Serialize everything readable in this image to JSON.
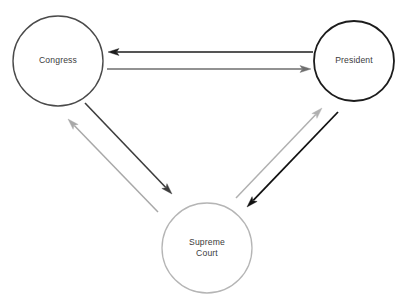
{
  "diagram": {
    "type": "node-link-diagram",
    "background_color": "#ffffff",
    "nodes": [
      {
        "id": "congress",
        "label": "Congress",
        "label_lines": [
          "Congress"
        ],
        "cx": 58,
        "cy": 61,
        "r": 45,
        "stroke": "#4a4a4a",
        "stroke_width": 1.4
      },
      {
        "id": "president",
        "label": "President",
        "label_lines": [
          "President"
        ],
        "cx": 354,
        "cy": 61,
        "r": 40,
        "stroke": "#1c1c1c",
        "stroke_width": 1.8
      },
      {
        "id": "supreme_court",
        "label": "Supreme Court",
        "label_lines": [
          "Supreme",
          "Court"
        ],
        "cx": 207,
        "cy": 248,
        "r": 45,
        "stroke": "#b5b5b5",
        "stroke_width": 1.3
      }
    ],
    "edges": [
      {
        "id": "president-to-congress",
        "from": "president",
        "to": "congress",
        "tone": "dark",
        "color": "#1c1c1c",
        "stroke_width": 1.6,
        "x1": 313,
        "y1": 52,
        "x2": 108,
        "y2": 52
      },
      {
        "id": "congress-to-president",
        "from": "congress",
        "to": "president",
        "tone": "gray",
        "color": "#6e6e6e",
        "stroke_width": 1.5,
        "x1": 107,
        "y1": 69,
        "x2": 311,
        "y2": 69
      },
      {
        "id": "congress-to-supreme-court",
        "from": "congress",
        "to": "supreme_court",
        "tone": "dark",
        "color": "#3d3d3d",
        "stroke_width": 1.6,
        "x1": 85,
        "y1": 103,
        "x2": 172,
        "y2": 194
      },
      {
        "id": "supreme-court-to-congress",
        "from": "supreme_court",
        "to": "congress",
        "tone": "gray",
        "color": "#a8a8a8",
        "stroke_width": 1.5,
        "x1": 158,
        "y1": 212,
        "x2": 68,
        "y2": 119
      },
      {
        "id": "president-to-supreme-court",
        "from": "president",
        "to": "supreme_court",
        "tone": "dark",
        "color": "#111111",
        "stroke_width": 1.8,
        "x1": 338,
        "y1": 112,
        "x2": 247,
        "y2": 207
      },
      {
        "id": "supreme-court-to-president",
        "from": "supreme_court",
        "to": "president",
        "tone": "gray",
        "color": "#b0b0b0",
        "stroke_width": 1.5,
        "x1": 236,
        "y1": 198,
        "x2": 322,
        "y2": 108
      }
    ],
    "arrowhead_length": 11,
    "arrowhead_width": 7
  }
}
